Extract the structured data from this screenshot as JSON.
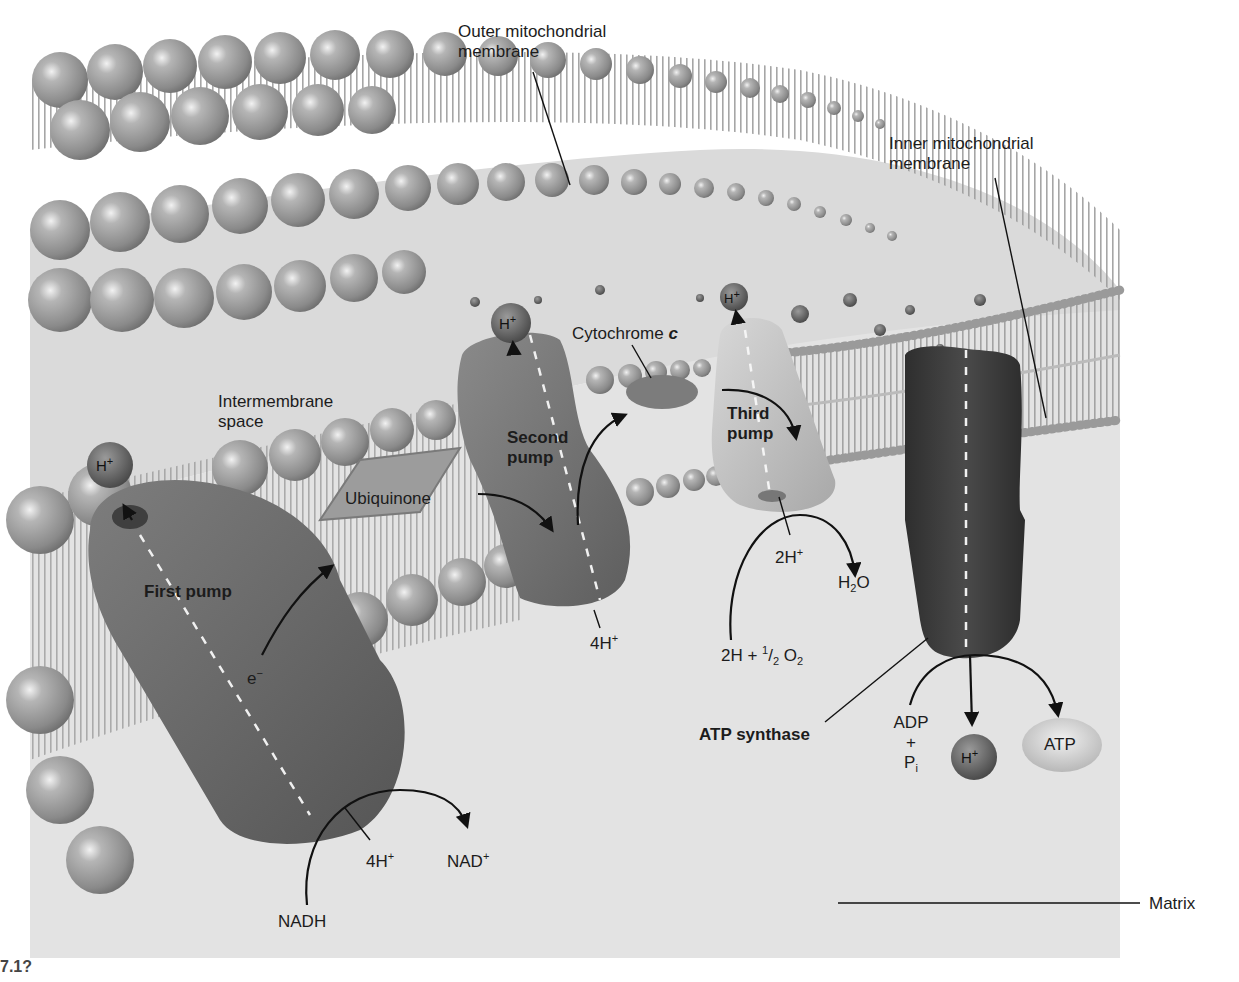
{
  "figure": {
    "title_hidden": "Electron transport chain in the mitochondrion",
    "colors": {
      "background": "#ffffff",
      "matrix": "#e4e4e4",
      "intermembrane": "#dcdcdc",
      "phospholipid_head": "#9a9a9a",
      "first_pump": "#6e6e6e",
      "second_pump": "#747474",
      "third_pump": "#c4c4c4",
      "atp_synthase": "#3c3c3c",
      "h_ion": "#5a5a5a",
      "atp_ellipse": "#d2d2d2"
    }
  },
  "labels": {
    "outer_membrane": [
      "Outer mitochondrial",
      "membrane"
    ],
    "inner_membrane": [
      "Inner mitochondrial",
      "membrane"
    ],
    "intermembrane_space": [
      "Intermembrane",
      "space"
    ],
    "cytochrome_c": "Cytochrome",
    "cytochrome_c_letter": "c",
    "ubiquinone": "Ubiquinone",
    "first_pump": "First pump",
    "second_pump": [
      "Second",
      "pump"
    ],
    "third_pump": [
      "Third",
      "pump"
    ],
    "atp_synthase": "ATP synthase",
    "matrix": "Matrix",
    "electron": "e",
    "electron_sup": "−",
    "nadh": "NADH",
    "nad_plus": "NAD",
    "nad_plus_sup": "+",
    "first_pump_h": "4H",
    "second_pump_h": "4H",
    "third_pump_h": "2H",
    "h_sup": "+",
    "oxygen_reactant_a": "2H + ",
    "oxygen_frac_num": "1",
    "oxygen_frac_den": "2",
    "oxygen_o": " O",
    "oxygen_sub": "2",
    "water_h": "H",
    "water_sub": "2",
    "water_o": "O",
    "adp": "ADP",
    "plus": "+",
    "pi": "P",
    "pi_sub": "i",
    "atp": "ATP",
    "h_ion": "H",
    "figure_number_partial": "7.1?"
  }
}
